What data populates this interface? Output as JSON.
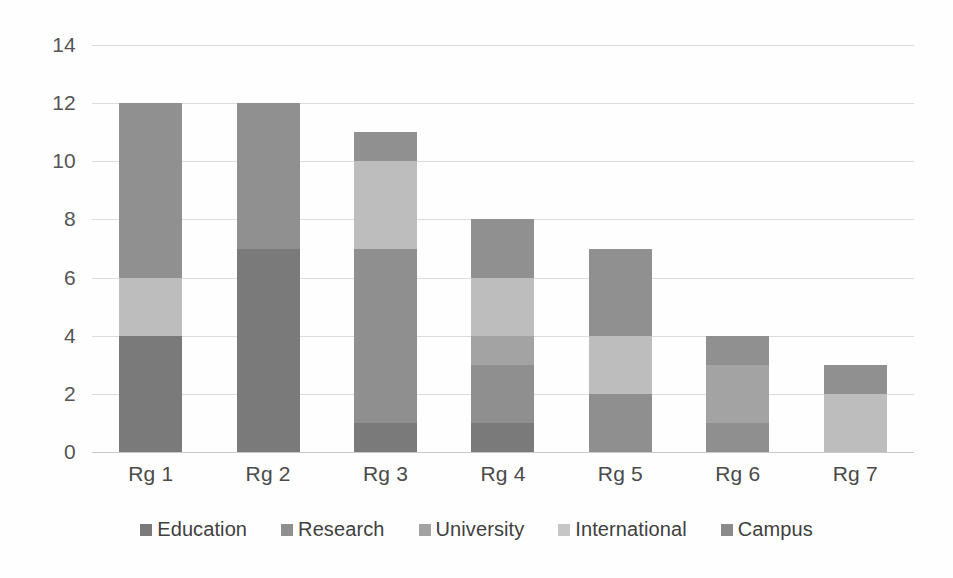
{
  "chart_data": {
    "type": "bar",
    "stacked": true,
    "title": "",
    "subtitle": "",
    "xlabel": "",
    "ylabel": "",
    "ylim": [
      0,
      14
    ],
    "ytick_step": 2,
    "yticks": [
      14,
      12,
      10,
      8,
      6,
      4,
      2,
      0
    ],
    "grid": true,
    "legend_position": "bottom",
    "categories": [
      "Rg 1",
      "Rg 2",
      "Rg 3",
      "Rg 4",
      "Rg 5",
      "Rg 6",
      "Rg 7"
    ],
    "series": [
      {
        "name": "Education",
        "color": "#7a7a7a",
        "values": [
          4,
          7,
          1,
          1,
          0,
          0,
          0
        ]
      },
      {
        "name": "Research",
        "color": "#8f8f8f",
        "values": [
          0,
          0,
          6,
          2,
          2,
          1,
          0
        ]
      },
      {
        "name": "University",
        "color": "#a3a3a3",
        "values": [
          0,
          0,
          0,
          1,
          0,
          2,
          0
        ]
      },
      {
        "name": "International",
        "color": "#bdbdbd",
        "values": [
          2,
          0,
          3,
          2,
          2,
          0,
          2
        ]
      },
      {
        "name": "Campus",
        "color": "#909090",
        "values": [
          6,
          5,
          1,
          2,
          3,
          1,
          1
        ]
      }
    ],
    "totals": [
      12,
      12,
      11,
      8,
      7,
      4,
      3
    ]
  },
  "axis": {
    "y_tick_labels": [
      "14",
      "12",
      "10",
      "8",
      "6",
      "4",
      "2",
      "0"
    ]
  },
  "legend": {
    "items": [
      {
        "label": "Education",
        "color": "#7a7a7a"
      },
      {
        "label": "Research",
        "color": "#8f8f8f"
      },
      {
        "label": "University",
        "color": "#a3a3a3"
      },
      {
        "label": "International",
        "color": "#c6c6c6"
      },
      {
        "label": "Campus",
        "color": "#8a8a8a"
      }
    ]
  }
}
